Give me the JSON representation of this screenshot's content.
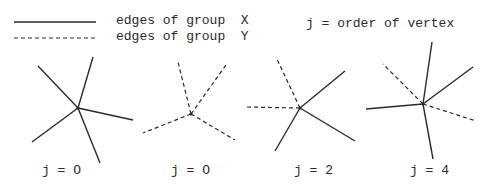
{
  "legend": {
    "solid_label": "edges of group  X",
    "dashed_label": "edges of group  Y"
  },
  "note": "j = order of vertex",
  "stars": [
    {
      "label": "j = O",
      "center": [
        78,
        108
      ],
      "edges": [
        {
          "to": [
            38,
            66
          ],
          "style": "solid"
        },
        {
          "to": [
            93,
            57
          ],
          "style": "solid"
        },
        {
          "to": [
            133,
            120
          ],
          "style": "solid"
        },
        {
          "to": [
            32,
            142
          ],
          "style": "solid"
        },
        {
          "to": [
            100,
            163
          ],
          "style": "solid"
        }
      ]
    },
    {
      "label": "j = O",
      "center": [
        191,
        114
      ],
      "edges": [
        {
          "to": [
            178,
            62
          ],
          "style": "dashed"
        },
        {
          "to": [
            226,
            65
          ],
          "style": "dashed"
        },
        {
          "to": [
            143,
            133
          ],
          "style": "dashed"
        },
        {
          "to": [
            235,
            140
          ],
          "style": "dashed"
        }
      ]
    },
    {
      "label": "j = 2",
      "center": [
        300,
        108
      ],
      "edges": [
        {
          "to": [
            276,
            57
          ],
          "style": "dashed"
        },
        {
          "to": [
            246,
            107
          ],
          "style": "dashed"
        },
        {
          "to": [
            345,
            71
          ],
          "style": "solid"
        },
        {
          "to": [
            355,
            141
          ],
          "style": "solid"
        },
        {
          "to": [
            275,
            151
          ],
          "style": "solid"
        }
      ]
    },
    {
      "label": "j = 4",
      "center": [
        423,
        104
      ],
      "edges": [
        {
          "to": [
            432,
            42
          ],
          "style": "solid"
        },
        {
          "to": [
            383,
            64
          ],
          "style": "dashed"
        },
        {
          "to": [
            473,
            67
          ],
          "style": "solid"
        },
        {
          "to": [
            366,
            109
          ],
          "style": "solid"
        },
        {
          "to": [
            476,
            121
          ],
          "style": "dashed"
        },
        {
          "to": [
            433,
            159
          ],
          "style": "solid"
        }
      ]
    }
  ],
  "colors": {
    "ink": "#2a2a2a",
    "background": "#ffffff"
  }
}
